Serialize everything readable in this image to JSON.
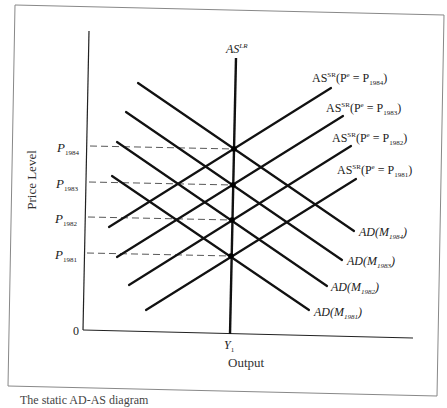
{
  "figure": {
    "caption": "The static AD-AS diagram",
    "x_axis_title": "Output",
    "y_axis_title": "Price Level",
    "origin_label": "0",
    "y1_label": {
      "main": "Y",
      "sub": "1"
    },
    "aslr_label": {
      "main": "AS",
      "sup": "LR"
    }
  },
  "chart_data": {
    "type": "line",
    "title": "",
    "xlabel": "Output",
    "ylabel": "Price Level",
    "x_ticks": [
      "Y1"
    ],
    "y_ticks": [
      "P1981",
      "P1982",
      "P1983",
      "P1984"
    ],
    "series": [
      {
        "name": "AS^LR",
        "kind": "vertical",
        "x": "Y1"
      },
      {
        "name": "AS^SR(P^e = P1981)",
        "kind": "upward",
        "equilibrium": "P1981"
      },
      {
        "name": "AS^SR(P^e = P1982)",
        "kind": "upward",
        "equilibrium": "P1982"
      },
      {
        "name": "AS^SR(P^e = P1983)",
        "kind": "upward",
        "equilibrium": "P1983"
      },
      {
        "name": "AS^SR(P^e = P1984)",
        "kind": "upward",
        "equilibrium": "P1984"
      },
      {
        "name": "AD(M1981)",
        "kind": "downward",
        "equilibrium": "P1981"
      },
      {
        "name": "AD(M1982)",
        "kind": "downward",
        "equilibrium": "P1982"
      },
      {
        "name": "AD(M1983)",
        "kind": "downward",
        "equilibrium": "P1983"
      },
      {
        "name": "AD(M1984)",
        "kind": "downward",
        "equilibrium": "P1984"
      }
    ],
    "grid": false,
    "legend": "inline labels at line ends"
  },
  "price_labels": [
    {
      "main": "P",
      "sub": "1984",
      "y": 149
    },
    {
      "main": "P",
      "sub": "1983",
      "y": 185
    },
    {
      "main": "P",
      "sub": "1982",
      "y": 220
    },
    {
      "main": "P",
      "sub": "1981",
      "y": 256
    }
  ],
  "as_labels": [
    {
      "text_pre": "AS",
      "sup": "SR",
      "mid": "(P",
      "sup2": "e",
      "eq": " = P",
      "sub": "1984",
      "post": ")"
    },
    {
      "text_pre": "AS",
      "sup": "SR",
      "mid": "(P",
      "sup2": "e",
      "eq": " = P",
      "sub": "1983",
      "post": ")"
    },
    {
      "text_pre": "AS",
      "sup": "SR",
      "mid": "(P",
      "sup2": "e",
      "eq": " = P",
      "sub": "1982",
      "post": ")"
    },
    {
      "text_pre": "AS",
      "sup": "SR",
      "mid": "(P",
      "sup2": "e",
      "eq": " = P",
      "sub": "1981",
      "post": ")"
    }
  ],
  "ad_labels": [
    {
      "pre": "AD(M",
      "sub": "1984",
      "post": ")"
    },
    {
      "pre": "AD(M",
      "sub": "1983",
      "post": ")"
    },
    {
      "pre": "AD(M",
      "sub": "1982",
      "post": ")"
    },
    {
      "pre": "AD(M",
      "sub": "1981",
      "post": ")"
    }
  ],
  "geometry": {
    "frame": [
      [
        15,
        5
      ],
      [
        444,
        15
      ],
      [
        437,
        396
      ],
      [
        8,
        386
      ]
    ],
    "y_axis": [
      [
        89,
        31
      ],
      [
        83,
        330
      ]
    ],
    "x_axis": [
      [
        83,
        330
      ],
      [
        413,
        338
      ]
    ],
    "aslr": [
      [
        236,
        58
      ],
      [
        230,
        334
      ]
    ],
    "as_lines": [
      [
        [
          109,
          227
        ],
        [
          331,
          88
        ]
      ],
      [
        [
          117,
          257
        ],
        [
          343,
          116
        ]
      ],
      [
        [
          129,
          285
        ],
        [
          351,
          146
        ]
      ],
      [
        [
          146,
          310
        ],
        [
          356,
          179
        ]
      ]
    ],
    "ad_lines": [
      [
        [
          138,
          83
        ],
        [
          354,
          231
        ]
      ],
      [
        [
          126,
          112
        ],
        [
          342,
          260
        ]
      ],
      [
        [
          117,
          142
        ],
        [
          327,
          286
        ]
      ],
      [
        [
          112,
          176
        ],
        [
          309,
          310
        ]
      ]
    ],
    "dashes": [
      [
        [
          90,
          146
        ],
        [
          234,
          149
        ]
      ],
      [
        [
          89,
          182
        ],
        [
          233,
          185
        ]
      ],
      [
        [
          88,
          217
        ],
        [
          232,
          220
        ]
      ],
      [
        [
          87,
          253
        ],
        [
          231,
          256
        ]
      ]
    ],
    "eq_points": [
      [
        234,
        149
      ],
      [
        233,
        185
      ],
      [
        232,
        220
      ],
      [
        231,
        256
      ]
    ]
  }
}
